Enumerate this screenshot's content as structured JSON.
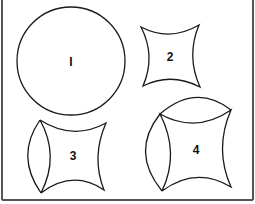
{
  "diagram": {
    "shapes": [
      {
        "id": "1",
        "label": "I",
        "kind": "circle"
      },
      {
        "id": "2",
        "label": "2",
        "kind": "concave-square"
      },
      {
        "id": "3",
        "label": "3",
        "kind": "concave-square-with-left-lens"
      },
      {
        "id": "4",
        "label": "4",
        "kind": "concave-square-with-top-and-left-lens"
      }
    ]
  },
  "colors": {
    "stroke": "#1a1a1a",
    "border": "#555555",
    "background": "#ffffff"
  }
}
